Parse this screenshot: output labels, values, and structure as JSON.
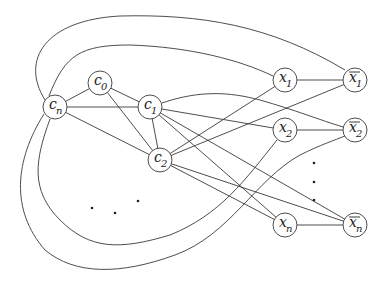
{
  "diagram": {
    "nodes": [
      {
        "id": "cn",
        "base": "c",
        "sub": "n",
        "bar": false,
        "x": 55,
        "y": 107
      },
      {
        "id": "c0",
        "base": "c",
        "sub": "0",
        "bar": false,
        "x": 100,
        "y": 83
      },
      {
        "id": "c1",
        "base": "c",
        "sub": "1",
        "bar": false,
        "x": 150,
        "y": 107
      },
      {
        "id": "c2",
        "base": "c",
        "sub": "2",
        "bar": false,
        "x": 160,
        "y": 160
      },
      {
        "id": "x1",
        "base": "x",
        "sub": "1",
        "bar": false,
        "x": 285,
        "y": 80
      },
      {
        "id": "x1bar",
        "base": "x",
        "sub": "1",
        "bar": true,
        "x": 355,
        "y": 80
      },
      {
        "id": "x2",
        "base": "x",
        "sub": "2",
        "bar": false,
        "x": 285,
        "y": 130
      },
      {
        "id": "x2bar",
        "base": "x",
        "sub": "2",
        "bar": true,
        "x": 355,
        "y": 130
      },
      {
        "id": "xn",
        "base": "x",
        "sub": "n",
        "bar": false,
        "x": 285,
        "y": 225
      },
      {
        "id": "xnbar",
        "base": "x",
        "sub": "n",
        "bar": true,
        "x": 355,
        "y": 225
      }
    ],
    "edges": [
      [
        "cn",
        "c0"
      ],
      [
        "cn",
        "c1"
      ],
      [
        "cn",
        "c2"
      ],
      [
        "c0",
        "c1"
      ],
      [
        "c0",
        "c2"
      ],
      [
        "c1",
        "c2"
      ],
      [
        "x1",
        "x1bar"
      ],
      [
        "x2",
        "x2bar"
      ],
      [
        "xn",
        "xnbar"
      ],
      [
        "c1",
        "x2"
      ],
      [
        "c1",
        "xn"
      ],
      [
        "c1",
        "xnbar"
      ],
      [
        "c2",
        "x1"
      ],
      [
        "c2",
        "x1bar"
      ],
      [
        "c2",
        "xn"
      ],
      [
        "c2",
        "xnbar"
      ]
    ],
    "curved_edges": [
      {
        "from": "c1",
        "to": "x2bar",
        "path": "M162,103 C200,90 230,92 260,100 C295,110 320,120 343,127"
      },
      {
        "from": "cn",
        "to": "x1",
        "path": "M49,96 C65,55 80,45 130,45 C190,47 240,60 273,76"
      },
      {
        "from": "cn",
        "to": "x1bar",
        "path": "M45,100 C20,60 45,20 120,16 C200,14 270,25 345,70"
      },
      {
        "from": "cn",
        "to": "x2",
        "path": "M50,119 C35,160 30,190 60,220 C90,250 120,250 170,235 C220,215 245,180 277,140"
      },
      {
        "from": "cn",
        "to": "x2bar",
        "path": "M44,114 C15,160 10,210 45,250 C75,275 120,275 175,255 C230,235 255,180 300,155 C320,145 335,140 345,136"
      }
    ],
    "ellipsis_left": [
      {
        "x": 92,
        "y": 208
      },
      {
        "x": 115,
        "y": 213
      },
      {
        "x": 138,
        "y": 201
      }
    ],
    "ellipsis_right": [
      {
        "x": 314,
        "y": 163
      },
      {
        "x": 314,
        "y": 182
      },
      {
        "x": 314,
        "y": 200
      }
    ],
    "node_radius": 12
  }
}
